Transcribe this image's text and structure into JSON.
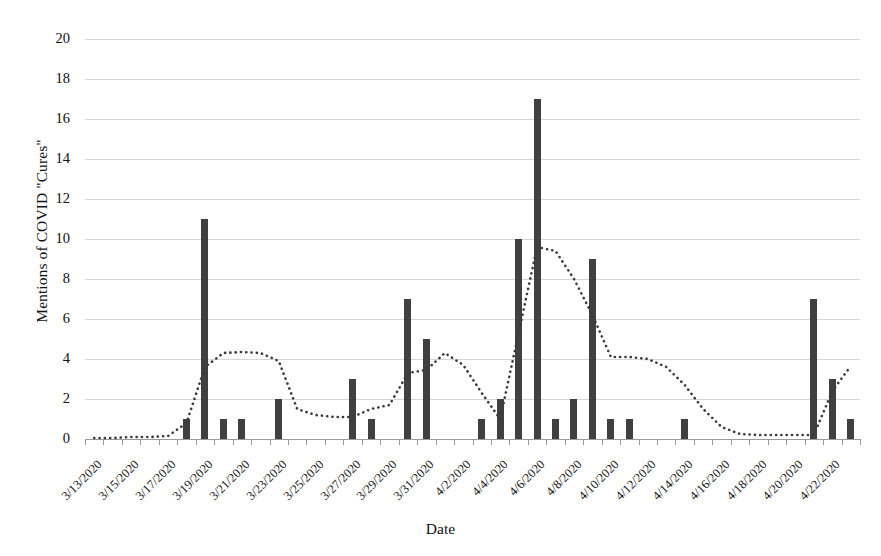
{
  "chart_data": {
    "type": "bar",
    "title": "",
    "xlabel": "Date",
    "ylabel": "Mentions of COVID \"Cures\"",
    "ylim": [
      0,
      20
    ],
    "ytick_values": [
      0,
      2,
      4,
      6,
      8,
      10,
      12,
      14,
      16,
      18,
      20
    ],
    "ytick_labels": [
      "0",
      "2",
      "4",
      "6",
      "8",
      "10",
      "12",
      "14",
      "16",
      "18",
      "20"
    ],
    "grid": true,
    "legend_position": "none",
    "categories": [
      "3/13/2020",
      "3/14/2020",
      "3/15/2020",
      "3/16/2020",
      "3/17/2020",
      "3/18/2020",
      "3/19/2020",
      "3/20/2020",
      "3/21/2020",
      "3/22/2020",
      "3/23/2020",
      "3/24/2020",
      "3/25/2020",
      "3/26/2020",
      "3/27/2020",
      "3/28/2020",
      "3/29/2020",
      "3/30/2020",
      "3/31/2020",
      "4/1/2020",
      "4/2/2020",
      "4/3/2020",
      "4/4/2020",
      "4/5/2020",
      "4/6/2020",
      "4/7/2020",
      "4/8/2020",
      "4/9/2020",
      "4/10/2020",
      "4/11/2020",
      "4/12/2020",
      "4/13/2020",
      "4/14/2020",
      "4/15/2020",
      "4/16/2020",
      "4/17/2020",
      "4/18/2020",
      "4/19/2020",
      "4/20/2020",
      "4/21/2020",
      "4/22/2020",
      "4/23/2020"
    ],
    "xtick_labels": [
      "3/13/2020",
      "3/15/2020",
      "3/17/2020",
      "3/19/2020",
      "3/21/2020",
      "3/23/2020",
      "3/25/2020",
      "3/27/2020",
      "3/29/2020",
      "3/31/2020",
      "4/2/2020",
      "4/4/2020",
      "4/6/2020",
      "4/8/2020",
      "4/10/2020",
      "4/12/2020",
      "4/14/2020",
      "4/16/2020",
      "4/18/2020",
      "4/20/2020",
      "4/22/2020"
    ],
    "series": [
      {
        "name": "Mentions of COVID \"Cures\"",
        "render": "bar",
        "color": "#404040",
        "values": [
          0,
          0,
          0,
          0,
          0,
          1,
          11,
          1,
          1,
          0,
          2,
          0,
          0,
          0,
          3,
          1,
          0,
          7,
          5,
          0,
          0,
          1,
          2,
          10,
          17,
          1,
          2,
          9,
          1,
          1,
          0,
          0,
          1,
          0,
          0,
          0,
          0,
          0,
          0,
          7,
          3,
          1
        ]
      },
      {
        "name": "Trend (moving average)",
        "render": "dotted-line",
        "color": "#3a3a3a",
        "values": [
          0.05,
          0.05,
          0.1,
          0.1,
          0.15,
          0.8,
          3.6,
          4.3,
          4.35,
          4.3,
          3.9,
          1.5,
          1.2,
          1.1,
          1.1,
          1.5,
          1.7,
          3.3,
          3.45,
          4.3,
          3.7,
          2.3,
          1.0,
          5.3,
          9.6,
          9.4,
          8.0,
          6.2,
          4.1,
          4.1,
          4.0,
          3.6,
          2.7,
          1.5,
          0.6,
          0.25,
          0.2,
          0.2,
          0.2,
          0.2,
          2.4,
          3.65
        ]
      }
    ]
  },
  "axis": {
    "y_title": "Mentions of COVID \"Cures\"",
    "x_title": "Date"
  }
}
